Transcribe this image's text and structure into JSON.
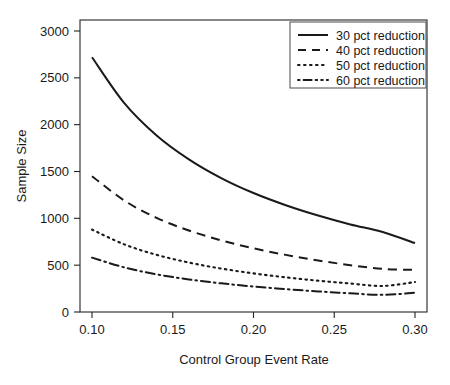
{
  "chart_data": {
    "type": "line",
    "title": "",
    "xlabel": "Control Group Event Rate",
    "ylabel": "Sample Size",
    "xlim": [
      0.1,
      0.3
    ],
    "ylim": [
      0,
      3000
    ],
    "grid": false,
    "legend_position": "top-right",
    "xticks": [
      "0.10",
      "0.15",
      "0.20",
      "0.25",
      "0.30"
    ],
    "xtick_values": [
      0.1,
      0.15,
      0.2,
      0.25,
      0.3
    ],
    "yticks": [
      "0",
      "500",
      "1000",
      "1500",
      "2000",
      "2500",
      "3000"
    ],
    "ytick_values": [
      0,
      500,
      1000,
      1500,
      2000,
      2500,
      3000
    ],
    "x": [
      0.1,
      0.12,
      0.14,
      0.16,
      0.18,
      0.2,
      0.22,
      0.24,
      0.26,
      0.28,
      0.3
    ],
    "series": [
      {
        "name": "30 pct reduction",
        "style": "solid",
        "values": [
          2720,
          2230,
          1885,
          1630,
          1430,
          1270,
          1140,
          1030,
          935,
          855,
          735
        ]
      },
      {
        "name": "40 pct reduction",
        "style": "dashed",
        "values": [
          1450,
          1190,
          1005,
          870,
          765,
          680,
          610,
          550,
          500,
          460,
          450
        ]
      },
      {
        "name": "50 pct reduction",
        "style": "dotted",
        "values": [
          880,
          722,
          610,
          528,
          464,
          412,
          370,
          334,
          304,
          278,
          320
        ]
      },
      {
        "name": "60 pct reduction",
        "style": "dashdot",
        "values": [
          580,
          476,
          402,
          348,
          306,
          272,
          244,
          220,
          200,
          183,
          205
        ]
      }
    ]
  },
  "legend": {
    "entries": [
      {
        "label": "30 pct reduction",
        "style": "solid"
      },
      {
        "label": "40 pct reduction",
        "style": "dashed"
      },
      {
        "label": "50 pct reduction",
        "style": "dotted"
      },
      {
        "label": "60 pct reduction",
        "style": "dashdot"
      }
    ]
  },
  "colors": {
    "line": "#1a1a1a",
    "axis": "#262626",
    "legend_border": "#595959",
    "background": "#ffffff"
  }
}
